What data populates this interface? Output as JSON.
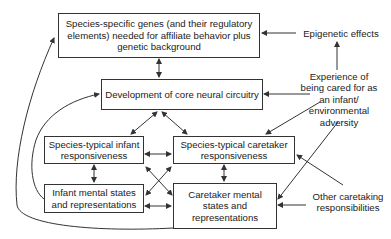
{
  "diagram": {
    "type": "flow-diagram",
    "nodes": {
      "genes": "Species-specific genes (and their regulatory elements) needed for affiliate behavior plus genetic background",
      "core": "Development of core neural circuitry",
      "infant_resp": "Species-typical infant responsiveness",
      "caretaker_resp": "Species-typical caretaker responsiveness",
      "infant_mental": "Infant mental states and representations",
      "caretaker_mental": "Caretaker mental states and representations"
    },
    "labels": {
      "epigenetic": "Epigenetic effects",
      "experience": "Experience of being cared for as an infant/ environmental adversity",
      "other": "Other caretaking responsibilities"
    },
    "edges": [
      {
        "from": "genes",
        "to": "core",
        "bidirectional": true
      },
      {
        "from": "epigenetic",
        "to": "genes"
      },
      {
        "from": "experience",
        "to": "epigenetic"
      },
      {
        "from": "experience",
        "to": "core"
      },
      {
        "from": "experience",
        "to": "caretaker_resp"
      },
      {
        "from": "experience",
        "to": "caretaker_mental"
      },
      {
        "from": "other",
        "to": "caretaker_resp"
      },
      {
        "from": "other",
        "to": "caretaker_mental"
      },
      {
        "from": "core",
        "to": "infant_resp",
        "bidirectional": true
      },
      {
        "from": "core",
        "to": "caretaker_resp",
        "bidirectional": true
      },
      {
        "from": "infant_resp",
        "to": "caretaker_resp",
        "bidirectional": true
      },
      {
        "from": "infant_resp",
        "to": "infant_mental",
        "bidirectional": true
      },
      {
        "from": "caretaker_resp",
        "to": "caretaker_mental",
        "bidirectional": true
      },
      {
        "from": "infant_resp",
        "to": "caretaker_mental",
        "bidirectional": true
      },
      {
        "from": "caretaker_resp",
        "to": "infant_mental",
        "bidirectional": true
      },
      {
        "from": "infant_mental",
        "to": "caretaker_mental",
        "bidirectional": true
      },
      {
        "from": "caretaker_mental",
        "to": "genes",
        "curved": true
      },
      {
        "from": "infant_mental",
        "to": "core",
        "curved": true
      }
    ]
  },
  "colors": {
    "line": "#333333",
    "box_border": "#333333",
    "text": "#222222",
    "background": "#ffffff"
  }
}
